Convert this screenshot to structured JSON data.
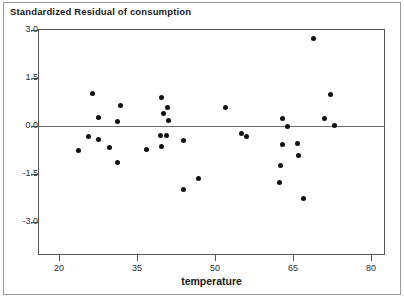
{
  "window": {
    "background_color": "#ffffff",
    "border_color": "#9a9a9a"
  },
  "chart_data": {
    "type": "scatter",
    "title": "Standardized Residual of consumption",
    "xlabel": "temperature",
    "ylabel": "",
    "xlim": [
      17,
      83
    ],
    "ylim": [
      -3.4,
      3.3
    ],
    "xticks": [
      20,
      35,
      50,
      65,
      80
    ],
    "yticks": [
      3.0,
      1.5,
      0.0,
      -1.5,
      -3.0
    ],
    "ytick_labels": [
      "3.0",
      "1.5",
      "0.0",
      "-1.5",
      "-3.0"
    ],
    "grid": false,
    "legend": null,
    "reference_line": {
      "axis": "y",
      "value": 0.0,
      "color": "#6f6f6f"
    },
    "marker": {
      "shape": "circle",
      "color": "#111111",
      "size": 5
    },
    "points": [
      {
        "x": 23.8,
        "y": -0.75
      },
      {
        "x": 26.5,
        "y": 1.03
      },
      {
        "x": 27.5,
        "y": 0.28
      },
      {
        "x": 25.6,
        "y": -0.34
      },
      {
        "x": 27.5,
        "y": -0.41
      },
      {
        "x": 31.9,
        "y": 0.63
      },
      {
        "x": 31.2,
        "y": 0.13
      },
      {
        "x": 29.8,
        "y": -0.66
      },
      {
        "x": 31.2,
        "y": -1.13
      },
      {
        "x": 39.8,
        "y": 0.88
      },
      {
        "x": 40.0,
        "y": 0.38
      },
      {
        "x": 39.6,
        "y": -0.31
      },
      {
        "x": 39.8,
        "y": -0.63
      },
      {
        "x": 40.9,
        "y": 0.59
      },
      {
        "x": 41.0,
        "y": 0.16
      },
      {
        "x": 40.6,
        "y": -0.31
      },
      {
        "x": 44.0,
        "y": -0.44
      },
      {
        "x": 44.0,
        "y": -1.97
      },
      {
        "x": 52.0,
        "y": 0.59
      },
      {
        "x": 55.0,
        "y": -0.22
      },
      {
        "x": 56.0,
        "y": -0.34
      },
      {
        "x": 63.0,
        "y": 0.25
      },
      {
        "x": 62.9,
        "y": -0.59
      },
      {
        "x": 62.6,
        "y": -1.22
      },
      {
        "x": 64.0,
        "y": 0.0
      },
      {
        "x": 62.4,
        "y": -1.78
      },
      {
        "x": 66.0,
        "y": -0.91
      },
      {
        "x": 67.0,
        "y": -2.28
      },
      {
        "x": 69.0,
        "y": 2.75
      },
      {
        "x": 72.3,
        "y": 1.0
      },
      {
        "x": 71.0,
        "y": 0.22
      },
      {
        "x": 73.0,
        "y": 0.03
      },
      {
        "x": 65.9,
        "y": -0.56
      },
      {
        "x": 46.9,
        "y": -1.63
      },
      {
        "x": 36.8,
        "y": -0.72
      }
    ]
  }
}
